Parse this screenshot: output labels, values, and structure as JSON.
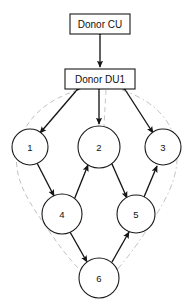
{
  "diagram": {
    "canvas": {
      "width": 193,
      "height": 307,
      "background": "#ffffff"
    },
    "boxes": [
      {
        "id": "donor-cu",
        "label": "Donor CU",
        "x": 70,
        "y": 14,
        "w": 60,
        "h": 20,
        "cx": 100,
        "cy": 24
      },
      {
        "id": "donor-du1",
        "label": "Donor DU1",
        "x": 65,
        "y": 69,
        "w": 70,
        "h": 20,
        "cx": 100,
        "cy": 79
      }
    ],
    "nodes": [
      {
        "id": "node-1",
        "label": "1",
        "cx": 30,
        "cy": 147,
        "r": 18
      },
      {
        "id": "node-2",
        "label": "2",
        "cx": 99,
        "cy": 147,
        "r": 21
      },
      {
        "id": "node-3",
        "label": "3",
        "cx": 163,
        "cy": 147,
        "r": 18
      },
      {
        "id": "node-4",
        "label": "4",
        "cx": 62,
        "cy": 214,
        "r": 20
      },
      {
        "id": "node-5",
        "label": "5",
        "cx": 136,
        "cy": 214,
        "r": 19
      },
      {
        "id": "node-6",
        "label": "6",
        "cx": 99,
        "cy": 278,
        "r": 20
      }
    ],
    "edges": [
      {
        "id": "edge-cu-du1",
        "from": "donor-cu",
        "to": "donor-du1",
        "arrows": "both",
        "style": "solid"
      },
      {
        "id": "edge-du1-1",
        "from": "donor-du1",
        "to": "node-1",
        "arrows": "both",
        "style": "solid"
      },
      {
        "id": "edge-du1-2",
        "from": "donor-du1",
        "to": "node-2",
        "arrows": "both",
        "style": "solid"
      },
      {
        "id": "edge-du1-3",
        "from": "donor-du1",
        "to": "node-3",
        "arrows": "both",
        "style": "solid"
      },
      {
        "id": "edge-1-4",
        "from": "node-1",
        "to": "node-4",
        "arrows": "both",
        "style": "solid"
      },
      {
        "id": "edge-4-2",
        "from": "node-4",
        "to": "node-2",
        "arrows": "both",
        "style": "solid"
      },
      {
        "id": "edge-2-5",
        "from": "node-2",
        "to": "node-5",
        "arrows": "both",
        "style": "solid"
      },
      {
        "id": "edge-5-3",
        "from": "node-5",
        "to": "node-3",
        "arrows": "both",
        "style": "solid"
      },
      {
        "id": "edge-4-6",
        "from": "node-4",
        "to": "node-6",
        "arrows": "both",
        "style": "solid"
      },
      {
        "id": "edge-6-5",
        "from": "node-6",
        "to": "node-5",
        "arrows": "both",
        "style": "solid"
      }
    ],
    "guide_paths": [
      {
        "id": "guide-left",
        "style": "dashed",
        "color": "#b9b9b9",
        "description": "left loop from Donor DU1 through node 1 and node 4 to node 6"
      },
      {
        "id": "guide-right",
        "style": "dashdot",
        "color": "#bdbdbd",
        "description": "right loop from Donor DU1 through node 3 and node 5 to node 6"
      },
      {
        "id": "guide-center",
        "style": "dashed",
        "color": "#c0c0c0",
        "description": "center line from Donor DU1 down through node 2"
      }
    ],
    "colors": {
      "stroke": "#1a1a1a",
      "edge": "#151515",
      "guide": "#b9b9b9",
      "fill": "#ffffff",
      "text": "#111111"
    }
  }
}
